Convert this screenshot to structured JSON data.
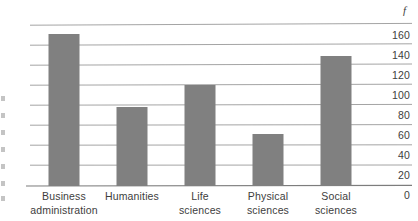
{
  "chart_data": {
    "type": "bar",
    "title": "",
    "xlabel": "",
    "ylabel": "f",
    "ylim": [
      0,
      160
    ],
    "yticks": [
      160,
      140,
      120,
      100,
      80,
      60,
      40,
      20,
      0
    ],
    "ytick_labels": [
      "160",
      "140",
      "120",
      "100",
      "80",
      "60",
      "40",
      "20",
      "0"
    ],
    "grid": true,
    "legend": "none",
    "categories": [
      "Business administration",
      "Humanities",
      "Life sciences",
      "Physical sciences",
      "Social sciences"
    ],
    "category_lines": [
      [
        "Business",
        "administration"
      ],
      [
        "Humanities"
      ],
      [
        "Life",
        "sciences"
      ],
      [
        "Physical",
        "sciences"
      ],
      [
        "Social",
        "sciences"
      ]
    ],
    "values": [
      152,
      79,
      101,
      52,
      130
    ],
    "bar_color": "#808080",
    "grid_color": "#9a9a9a",
    "axis_color": "#8a8a8a"
  }
}
